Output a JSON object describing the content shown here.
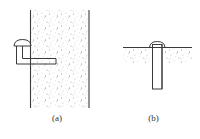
{
  "figure": {
    "panels": [
      {
        "id": "a",
        "label": "(a)",
        "description": "L-shaped anchor bolt embedded horizontally into the side of a vertical concrete wall, with dome-shaped head protruding outward"
      },
      {
        "id": "b",
        "label": "(b)",
        "description": "Straight anchor rod embedded vertically into a horizontal concrete surface, with dome-shaped head above ground line"
      }
    ],
    "colors": {
      "line": "#3a3a3a",
      "concrete_speckle": "#8a8a8a",
      "background": "#ffffff"
    }
  }
}
